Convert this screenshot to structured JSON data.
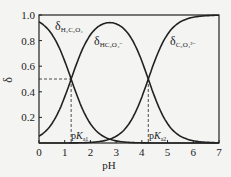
{
  "chart_data": {
    "type": "line",
    "title": "",
    "xlabel": "pH",
    "ylabel": "δ",
    "xlim": [
      0,
      7
    ],
    "ylim": [
      0,
      1.0
    ],
    "x_ticks": [
      "0",
      "1",
      "2",
      "3",
      "4",
      "5",
      "6",
      "7"
    ],
    "y_ticks": [
      "0.2",
      "0.4",
      "0.6",
      "0.8",
      "1.0"
    ],
    "pKa1": 1.25,
    "pKa2": 4.25,
    "series": [
      {
        "name": "δH2C2O4",
        "label_main": "δ",
        "label_sub": "H₂C₂O₄"
      },
      {
        "name": "δHC2O4-",
        "label_main": "δ",
        "label_sub": "HC₂O₄⁻"
      },
      {
        "name": "δC2O4 2-",
        "label_main": "δ",
        "label_sub": "C₂O₄²⁻"
      }
    ],
    "annotations": [
      {
        "text": "pKa1",
        "x": 1.25,
        "y": 0.5
      },
      {
        "text": "pKa2",
        "x": 4.25,
        "y": 0.5
      }
    ],
    "grid": false,
    "legend": "inline labels"
  },
  "labels": {
    "pka1_p": "p",
    "pka1_k": "K",
    "pka1_sub": "a1",
    "pka2_p": "p",
    "pka2_k": "K",
    "pka2_sub": "a2"
  }
}
